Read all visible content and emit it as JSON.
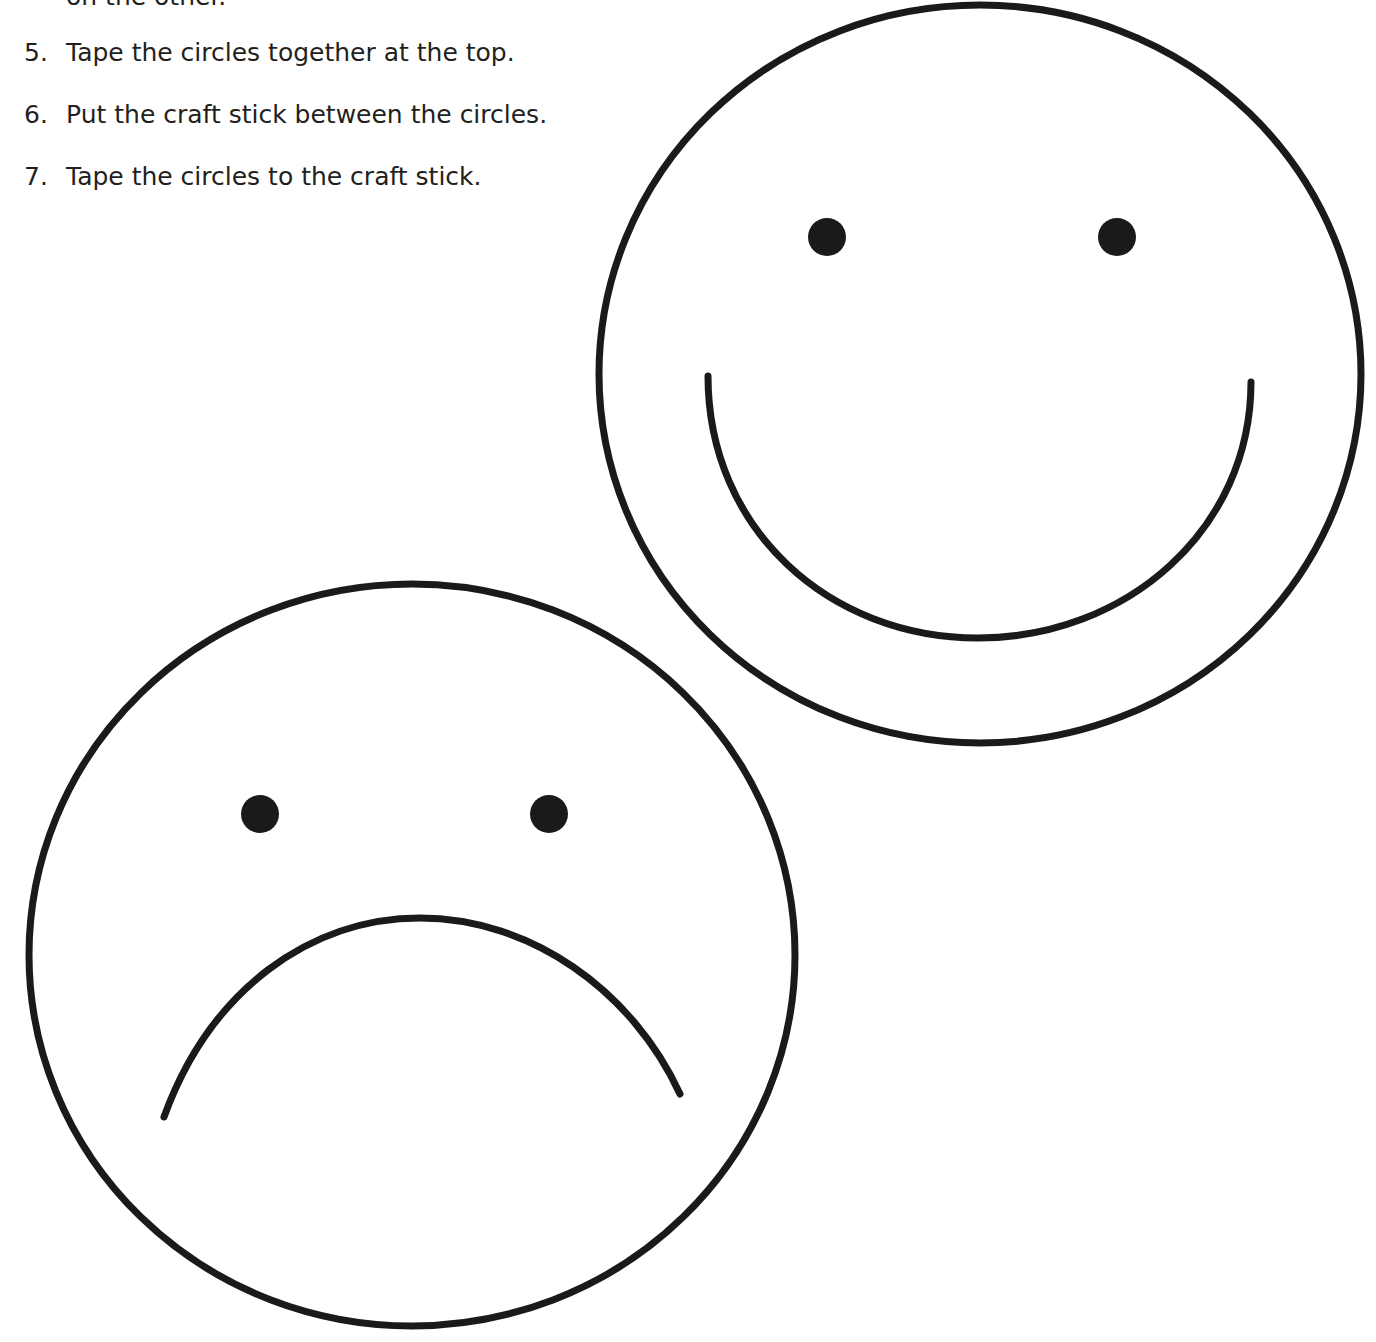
{
  "instructions": {
    "cutoff_line": "on the other.",
    "steps": [
      {
        "number": "5.",
        "text": "Tape the circles together at the top."
      },
      {
        "number": "6.",
        "text": "Put the craft stick between the circles."
      },
      {
        "number": "7.",
        "text": "Tape the circles to the craft stick."
      }
    ]
  },
  "faces": [
    {
      "name": "happy-face",
      "expression": "smile"
    },
    {
      "name": "sad-face",
      "expression": "frown"
    }
  ],
  "colors": {
    "ink": "#1a1a1a",
    "text": "#231f20",
    "background": "#ffffff"
  }
}
